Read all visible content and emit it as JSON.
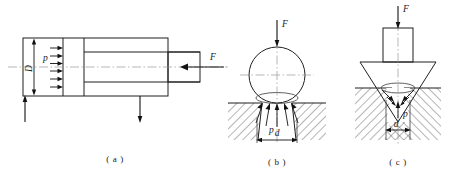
{
  "figure": {
    "title": "",
    "background_color": "#ffffff",
    "line_color": "#1f1f1f",
    "centerline_color": "#9a9a9a",
    "hatch_color": "#2a2a2a"
  },
  "panels": [
    {
      "id": "a",
      "caption": "( a )",
      "name": "hydraulic-cylinder-piston",
      "labels": {
        "diameter": "D",
        "pressure": "p",
        "force": "F"
      },
      "pressure_arrow_count": 6,
      "reaction_arrows": [
        {
          "name": "left-up-reaction",
          "direction": "up"
        },
        {
          "name": "right-down-reaction",
          "direction": "down"
        }
      ],
      "force_direction": "left"
    },
    {
      "id": "b",
      "caption": "( b )",
      "name": "sphere-indentation",
      "labels": {
        "force": "F",
        "pressure": "p",
        "diameter": "d"
      },
      "pressure_arrow_count": 5,
      "force_direction": "down"
    },
    {
      "id": "c",
      "caption": "( c )",
      "name": "cone-indentation",
      "labels": {
        "force": "F",
        "pressure": "p",
        "diameter": "d"
      },
      "pressure_arrow_count": 4,
      "force_direction": "down"
    }
  ]
}
